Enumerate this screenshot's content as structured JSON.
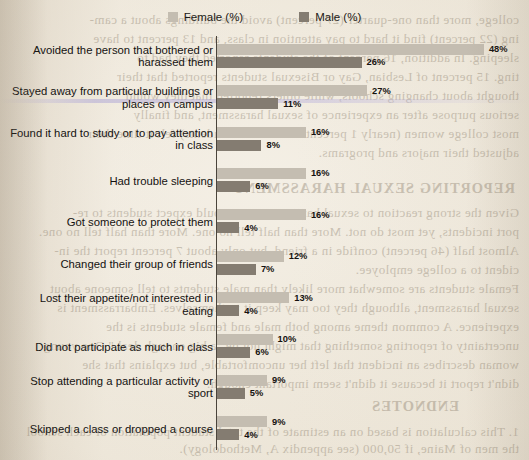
{
  "legend": {
    "female_label": "Female (%)",
    "male_label": "Male (%)",
    "female_color": "#c4bdb1",
    "male_color": "#847c71"
  },
  "page_bleed": {
    "lines": [
      "college, more than one-quarter (27 percent) avoid the buildings about a cam-",
      "ing (22 percent) find it hard to pay attention in class, and 13 percent to have",
      "sleeping. In addition, 16 percent of the students reported they had to",
      "ting. 15 percent of Lesbian, Gay or Bisexual students reported that their",
      "thought about changing schools, while others reported that they would",
      "serious purpose after an experience of sexual harassment, and finally",
      "most college women (nearly 1 percent of all LGBT students) felt it time their",
      "adjusted their majors and programs."
    ],
    "heading": "REPORTING SEXUAL HARASSMENT",
    "lines2": [
      "Given the strong reaction to sexual harassment, we would expect students to re-",
      "port incidents, yet most do not. More than half tell no one. More than half tell no one.",
      "Almost half (46 percent) confide in a friend, but only about 7 percent report the in-",
      "cident to a college employee.",
      "Female students are somewhat more likely than male students to tell someone about",
      "sexual harassment, although they too may keep it to themselves. Embarrassment is",
      "experience. A common theme among both male and female students is the",
      "uncertainty of reporting something that might not be \"a big enough deal.\" One young",
      "woman describes an incident that left her uncomfortable, but explains that she",
      "didn't report it because it didn't seem important enough."
    ],
    "endnotes_heading": "ENDNOTES",
    "endnotes": [
      "1.  This calculation is based on an estimate of the total student population of each school",
      "the men of Maine, if 50,000 (see appendix A, Methodology)."
    ]
  },
  "chart_data": {
    "type": "bar",
    "orientation": "horizontal",
    "title": "",
    "xlabel": "",
    "ylabel": "",
    "xlim": [
      0,
      48
    ],
    "grid": false,
    "legend_position": "top-center",
    "px_per_percent": 5.56,
    "categories": [
      "Avoided the person that bothered or harassed them",
      "Stayed away from particular buildings or places on campus",
      "Found it hard to study or to pay attention in class",
      "Had trouble sleeping",
      "Got someone to protect them",
      "Changed their group of friends",
      "Lost their appetite/not interested in eating",
      "Did not participate as much in class",
      "Stop attending a particular activity or sport",
      "Skipped a class or dropped a course"
    ],
    "series": [
      {
        "name": "Female (%)",
        "color": "#c4bdb1",
        "values": [
          48,
          27,
          16,
          16,
          16,
          12,
          13,
          10,
          9,
          9
        ],
        "labels": [
          "48%",
          "27%",
          "16%",
          "16%",
          "16%",
          "12%",
          "13%",
          "10%",
          "9%",
          "9%"
        ]
      },
      {
        "name": "Male (%)",
        "color": "#847c71",
        "values": [
          26,
          11,
          8,
          6,
          4,
          7,
          4,
          6,
          5,
          4
        ],
        "labels": [
          "26%",
          "11%",
          "8%",
          "6%",
          "4%",
          "7%",
          "4%",
          "6%",
          "5%",
          "4%"
        ]
      }
    ]
  }
}
